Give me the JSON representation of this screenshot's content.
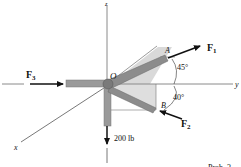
{
  "diagram": {
    "type": "3d-force-diagram",
    "axes": {
      "x": "x",
      "y": "y",
      "z": "z"
    },
    "points": {
      "origin": "O",
      "a": "A",
      "b": "B"
    },
    "forces": {
      "f1": {
        "letter": "F",
        "sub": "1"
      },
      "f2": {
        "letter": "F",
        "sub": "2"
      },
      "f3": {
        "letter": "F",
        "sub": "3"
      },
      "load": "200 lb"
    },
    "angles": {
      "a1": "45°",
      "a2": "40°"
    },
    "caption": "Prob. 3"
  },
  "colors": {
    "axis": "#8a8a8a",
    "member_fill": "#9a9a9a",
    "member_dark": "#6e6e6e",
    "plane_shade": "#d9d9d9",
    "arrow": "#111111"
  }
}
